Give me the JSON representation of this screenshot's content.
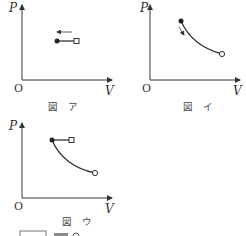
{
  "diagrams": [
    {
      "id": "a",
      "caption": "図　ア",
      "y_axis_label": "P",
      "x_axis_label": "V",
      "origin_label": "O",
      "description": "Horizontal segment at constant P from open square (right) to filled circle (left); arrow above pointing left"
    },
    {
      "id": "i",
      "caption": "図　イ",
      "y_axis_label": "P",
      "x_axis_label": "V",
      "origin_label": "O",
      "description": "Decreasing curve from filled circle (upper left) to open circle (lower right); arrow along curve pointing down-right"
    },
    {
      "id": "u",
      "caption": "図　ウ",
      "y_axis_label": "P",
      "x_axis_label": "V",
      "origin_label": "O",
      "description": "Filled circle with horizontal segment to open square on right, and decreasing curve to open circle on lower right"
    }
  ],
  "footer_fragment": "……"
}
